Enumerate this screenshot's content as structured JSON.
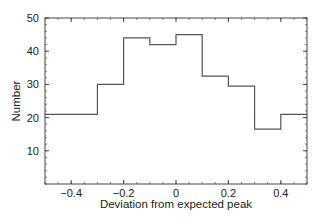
{
  "chart_data": {
    "type": "bar",
    "subtype": "step-histogram",
    "title": "",
    "xlabel": "Deviation from expected peak",
    "ylabel": "Number",
    "xlim": [
      -0.5,
      0.5
    ],
    "ylim": [
      0,
      50
    ],
    "x_ticks": [
      -0.4,
      -0.2,
      0,
      0.2,
      0.4
    ],
    "x_tick_labels": [
      "−0.4",
      "−0.2",
      "0",
      "0.2",
      "0.4"
    ],
    "y_ticks": [
      10,
      20,
      30,
      40,
      50
    ],
    "y_tick_labels": [
      "10",
      "20",
      "30",
      "40",
      "50"
    ],
    "bin_edges": [
      -0.5,
      -0.3,
      -0.2,
      -0.1,
      0.0,
      0.1,
      0.2,
      0.3,
      0.4,
      0.5
    ],
    "categories": [
      "-0.5 to -0.3",
      "-0.3 to -0.2",
      "-0.2 to -0.1",
      "-0.1 to 0.0",
      "0.0 to 0.1",
      "0.1 to 0.2",
      "0.2 to 0.3",
      "0.3 to 0.4",
      "0.4 to 0.5"
    ],
    "values": [
      21,
      30,
      44,
      42,
      45,
      32.5,
      29.5,
      16.5,
      21
    ],
    "grid": false,
    "legend": null,
    "colors": {
      "line": "#555555",
      "frame": "#444444",
      "text": "#222222"
    }
  }
}
